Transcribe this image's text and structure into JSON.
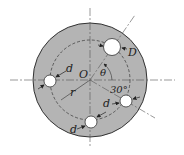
{
  "diagram": {
    "type": "mechanical-disk-with-holes",
    "colors": {
      "disk_fill": "#b4b4b4",
      "disk_edge": "#333333",
      "hole_fill": "#ffffff",
      "line": "#333333",
      "centerline": "#555555"
    },
    "labels": {
      "center": "O",
      "radius": "r",
      "angle_theta": "θ",
      "angle_fixed": "30°",
      "large_hole": "D",
      "small_hole_left": "d",
      "small_hole_right": "d",
      "small_hole_bottom": "d"
    }
  }
}
